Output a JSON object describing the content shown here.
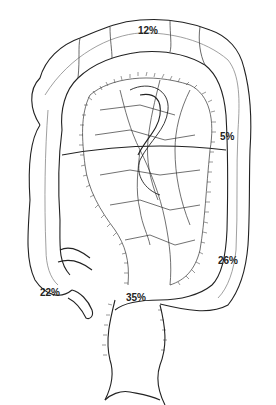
{
  "diagram": {
    "labels": [
      {
        "id": "transverse",
        "text": "12%",
        "x": 138,
        "y": 26
      },
      {
        "id": "splenic-flexure",
        "text": "5%",
        "x": 220,
        "y": 132
      },
      {
        "id": "ascending",
        "text": "22%",
        "x": 40,
        "y": 288
      },
      {
        "id": "descending",
        "text": "26%",
        "x": 218,
        "y": 256
      },
      {
        "id": "sigmoid",
        "text": "35%",
        "x": 126,
        "y": 293
      }
    ]
  }
}
